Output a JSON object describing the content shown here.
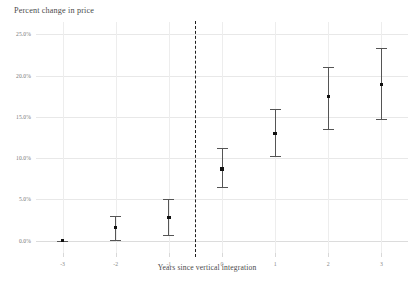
{
  "chart_data": {
    "type": "scatter",
    "title": "Percent change in price",
    "xlabel": "Years since vertical integration",
    "ylabel": "",
    "grid": true,
    "legend": null,
    "xlim": [
      -3.5,
      3.5
    ],
    "ylim": [
      -1.5,
      26.5
    ],
    "categories": [
      "-3",
      "-2",
      "-1",
      "0",
      "1",
      "2",
      "3"
    ],
    "x": [
      -3,
      -2,
      -1,
      0,
      1,
      2,
      3
    ],
    "ytick_labels": [
      "0.0%",
      "5.0%",
      "10.0%",
      "15.0%",
      "20.0%",
      "25.0%"
    ],
    "ytick_values": [
      0,
      5,
      10,
      15,
      20,
      25
    ],
    "xtick_labels": [
      "-3",
      "-2",
      "-1",
      "0",
      "1",
      "2",
      "3"
    ],
    "values": [
      0.0,
      1.6,
      2.8,
      8.7,
      13.0,
      17.5,
      18.9
    ],
    "ci_low": [
      0.0,
      0.05,
      0.7,
      6.5,
      10.2,
      13.5,
      14.7
    ],
    "ci_high": [
      0.0,
      3.0,
      5.0,
      11.2,
      16.0,
      21.1,
      23.4
    ],
    "points": [
      {
        "x": -3,
        "value": 0.0,
        "low": 0.0,
        "high": 0.0,
        "reference": true
      },
      {
        "x": -2,
        "value": 1.6,
        "low": 0.05,
        "high": 3.0,
        "reference": false
      },
      {
        "x": -1,
        "value": 2.8,
        "low": 0.7,
        "high": 5.0,
        "reference": false
      },
      {
        "x": 0,
        "value": 8.7,
        "low": 6.5,
        "high": 11.2,
        "reference": false
      },
      {
        "x": 1,
        "value": 13.0,
        "low": 10.2,
        "high": 16.0,
        "reference": false
      },
      {
        "x": 2,
        "value": 17.5,
        "low": 13.5,
        "high": 21.1,
        "reference": false
      },
      {
        "x": 3,
        "value": 18.9,
        "low": 14.7,
        "high": 23.4,
        "reference": false
      }
    ],
    "annotations": [
      {
        "type": "vline",
        "name": "treatment-reference-line",
        "x": -0.5,
        "style": "dashed",
        "color": "#1d1d1d"
      }
    ],
    "colors": {
      "marker": "#111111",
      "errorbar": "#555555",
      "grid": "#e8e8e8",
      "reference_line": "#1d1d1d",
      "text": "#4a4a4a",
      "tick_text": "#888888",
      "background": "#ffffff"
    }
  }
}
